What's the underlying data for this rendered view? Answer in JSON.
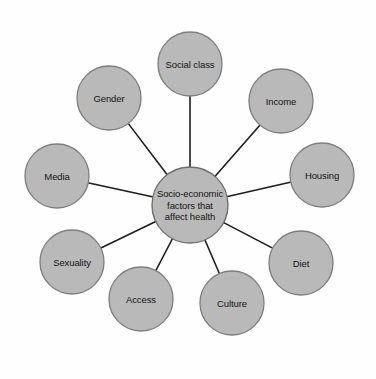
{
  "diagram": {
    "type": "radial-hub-and-spoke",
    "background_color": "#fefefe",
    "node_fill_color": "#b9b9b9",
    "node_stroke_color": "#7e7e7e",
    "connector_color": "#1d1d1d",
    "label_color": "#141414",
    "center": {
      "label_lines": [
        "Socio-economic",
        "factors that",
        "affect health"
      ],
      "label_full": "Socio-economic factors that affect health",
      "cx": 190,
      "cy": 205,
      "r": 38
    },
    "nodes": [
      {
        "label": "Social class",
        "cx": 190,
        "cy": 64,
        "r": 32
      },
      {
        "label": "Income",
        "cx": 281,
        "cy": 101,
        "r": 32
      },
      {
        "label": "Housing",
        "cx": 322,
        "cy": 175,
        "r": 32
      },
      {
        "label": "Diet",
        "cx": 301,
        "cy": 263,
        "r": 32
      },
      {
        "label": "Culture",
        "cx": 232,
        "cy": 303,
        "r": 32
      },
      {
        "label": "Access",
        "cx": 141,
        "cy": 299,
        "r": 32
      },
      {
        "label": "Sexuality",
        "cx": 72,
        "cy": 262,
        "r": 32
      },
      {
        "label": "Media",
        "cx": 57,
        "cy": 176,
        "r": 32
      },
      {
        "label": "Gender",
        "cx": 109,
        "cy": 98,
        "r": 32
      }
    ]
  }
}
